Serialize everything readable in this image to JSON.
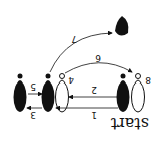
{
  "diagram": {
    "orientation": "rotated 180 degrees",
    "start_label": "start",
    "pins": [
      {
        "id": "pin-a",
        "fill": "black",
        "label": ""
      },
      {
        "id": "pin-b",
        "fill": "black",
        "label": ""
      },
      {
        "id": "pin-4",
        "fill": "white",
        "label": "4"
      },
      {
        "id": "pin-c",
        "fill": "black",
        "label": ""
      },
      {
        "id": "pin-8",
        "fill": "white",
        "label": "8"
      }
    ],
    "arrows": [
      {
        "label": "1",
        "from": "pin-c",
        "to": "pin-4"
      },
      {
        "label": "2",
        "from": "pin-c",
        "to": "pin-4"
      },
      {
        "label": "3",
        "from": "pin-b",
        "to": "pin-a"
      },
      {
        "label": "5",
        "from": "pin-a",
        "to": "pin-b"
      },
      {
        "label": "6",
        "from": "pin-4",
        "to": "pin-8"
      },
      {
        "label": "7",
        "from": "pin-b",
        "to": "fallen-pin"
      }
    ],
    "colors": {
      "ink": "#111111",
      "background": "#ffffff"
    }
  }
}
